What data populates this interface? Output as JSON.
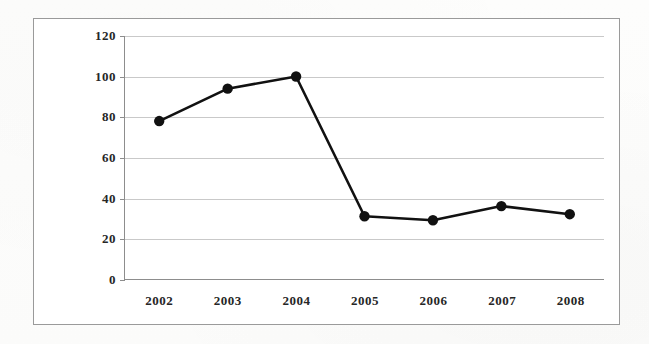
{
  "chart_data": {
    "type": "line",
    "title": "",
    "xlabel": "",
    "ylabel": "Number of papers",
    "categories": [
      "2002",
      "2003",
      "2004",
      "2005",
      "2006",
      "2007",
      "2008"
    ],
    "values": [
      78,
      94,
      100,
      31,
      29,
      36,
      32
    ],
    "series": [
      {
        "name": "Number of papers",
        "values": [
          78,
          94,
          100,
          31,
          29,
          36,
          32
        ]
      }
    ],
    "ylim": [
      0,
      120
    ],
    "yticks": [
      0,
      20,
      40,
      60,
      80,
      100,
      120
    ],
    "ytick_labels": [
      "0",
      "20",
      "40",
      "60",
      "80",
      "100",
      "120"
    ],
    "grid": true,
    "legend": false,
    "marker": "filled-circle",
    "line_color": "#111111",
    "marker_color": "#111111",
    "grid_color": "#c9c9c9",
    "axis_color": "#8d8d8d",
    "plot_background": "#ffffff"
  }
}
